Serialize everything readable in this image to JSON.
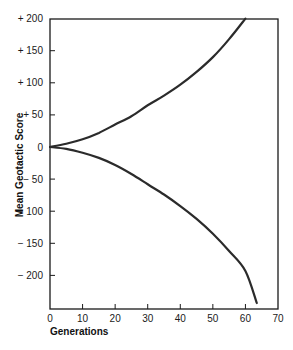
{
  "chart_data": {
    "type": "line",
    "title": "",
    "xlabel": "Generations",
    "ylabel": "Mean Geotactic Score",
    "xlim": [
      0,
      70
    ],
    "ylim": [
      -250,
      200
    ],
    "grid": false,
    "legend": null,
    "x_ticks": [
      0,
      10,
      20,
      30,
      40,
      50,
      60,
      70
    ],
    "x_tick_labels": [
      "0",
      "10",
      "20",
      "30",
      "40",
      "50",
      "60",
      "70"
    ],
    "y_ticks": [
      200,
      150,
      100,
      50,
      0,
      -50,
      -100,
      -150,
      -200
    ],
    "y_tick_labels": [
      "+ 200",
      "+ 150",
      "+ 100",
      "+ 50",
      "0",
      "− 50",
      "− 100",
      "− 150",
      "− 200"
    ],
    "series": [
      {
        "name": "Selected for positive geotaxis",
        "x": [
          0,
          5,
          10,
          15,
          20,
          25,
          30,
          35,
          40,
          45,
          50,
          55,
          60
        ],
        "values": [
          0,
          5,
          12,
          22,
          35,
          48,
          65,
          80,
          97,
          117,
          140,
          168,
          200
        ]
      },
      {
        "name": "Selected for negative geotaxis",
        "x": [
          0,
          5,
          10,
          15,
          20,
          25,
          30,
          35,
          40,
          45,
          50,
          55,
          60,
          63.5
        ],
        "values": [
          0,
          -3,
          -9,
          -17,
          -28,
          -42,
          -58,
          -74,
          -92,
          -112,
          -135,
          -162,
          -193,
          -243
        ]
      }
    ],
    "line_color": "#2b2b2b"
  }
}
